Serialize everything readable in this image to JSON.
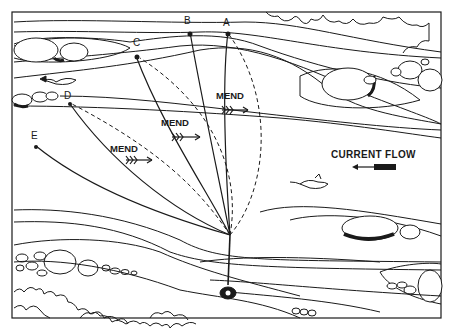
{
  "labels": {
    "points": [
      "A",
      "B",
      "C",
      "D",
      "E"
    ],
    "mend": [
      "MEND",
      "MEND",
      "MEND"
    ],
    "current_flow": "CURRENT FLOW"
  },
  "legend": {
    "solid_line": "cast line path",
    "dashed_line": "mended line path",
    "arrow_direction": "upstream-to-downstream mend"
  },
  "colors": {
    "ink": "#1a1a1a",
    "paper": "#ffffff"
  }
}
